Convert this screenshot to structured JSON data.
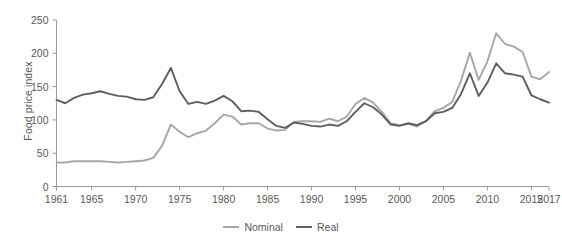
{
  "chart_data": {
    "type": "line",
    "title": "",
    "xlabel": "",
    "ylabel": "Food price index",
    "xlim": [
      1961,
      2017
    ],
    "ylim": [
      0,
      250
    ],
    "grid": false,
    "legend_position": "bottom-center",
    "xticks": [
      1961,
      1965,
      1970,
      1975,
      1980,
      1985,
      1990,
      1995,
      2000,
      2005,
      2010,
      2015,
      2017
    ],
    "yticks": [
      0,
      50,
      100,
      150,
      200,
      250
    ],
    "x": [
      1961,
      1962,
      1963,
      1964,
      1965,
      1966,
      1967,
      1968,
      1969,
      1970,
      1971,
      1972,
      1973,
      1974,
      1975,
      1976,
      1977,
      1978,
      1979,
      1980,
      1981,
      1982,
      1983,
      1984,
      1985,
      1986,
      1987,
      1988,
      1989,
      1990,
      1991,
      1992,
      1993,
      1994,
      1995,
      1996,
      1997,
      1998,
      1999,
      2000,
      2001,
      2002,
      2003,
      2004,
      2005,
      2006,
      2007,
      2008,
      2009,
      2010,
      2011,
      2012,
      2013,
      2014,
      2015,
      2016,
      2017
    ],
    "series": [
      {
        "name": "Nominal",
        "color": "#a7a7a7",
        "values": [
          36,
          36,
          38,
          38,
          38,
          38,
          37,
          36,
          37,
          38,
          39,
          43,
          61,
          93,
          82,
          74,
          80,
          84,
          95,
          108,
          105,
          93,
          95,
          95,
          87,
          84,
          85,
          97,
          98,
          98,
          97,
          102,
          98,
          105,
          124,
          133,
          126,
          112,
          95,
          92,
          94,
          90,
          98,
          113,
          118,
          127,
          159,
          201,
          160,
          188,
          230,
          214,
          210,
          202,
          165,
          161,
          172
        ]
      },
      {
        "name": "Real",
        "color": "#5e5e5e",
        "values": [
          130,
          125,
          133,
          138,
          140,
          143,
          139,
          136,
          135,
          131,
          130,
          134,
          154,
          178,
          143,
          124,
          127,
          124,
          129,
          136,
          128,
          113,
          114,
          112,
          101,
          91,
          88,
          96,
          94,
          91,
          90,
          93,
          91,
          98,
          112,
          125,
          119,
          108,
          93,
          91,
          95,
          92,
          98,
          110,
          112,
          118,
          139,
          170,
          136,
          156,
          185,
          170,
          168,
          165,
          137,
          131,
          126
        ]
      }
    ]
  },
  "legend": {
    "items": [
      {
        "label": "Nominal",
        "color": "#a7a7a7"
      },
      {
        "label": "Real",
        "color": "#5e5e5e"
      }
    ]
  },
  "axis": {
    "y_title": "Food price index",
    "ytick_labels": [
      "0",
      "50",
      "100",
      "150",
      "200",
      "250"
    ],
    "xtick_labels": [
      "1961",
      "1965",
      "1970",
      "1975",
      "1980",
      "1985",
      "1990",
      "1995",
      "2000",
      "2005",
      "2010",
      "2015",
      "2017"
    ]
  }
}
